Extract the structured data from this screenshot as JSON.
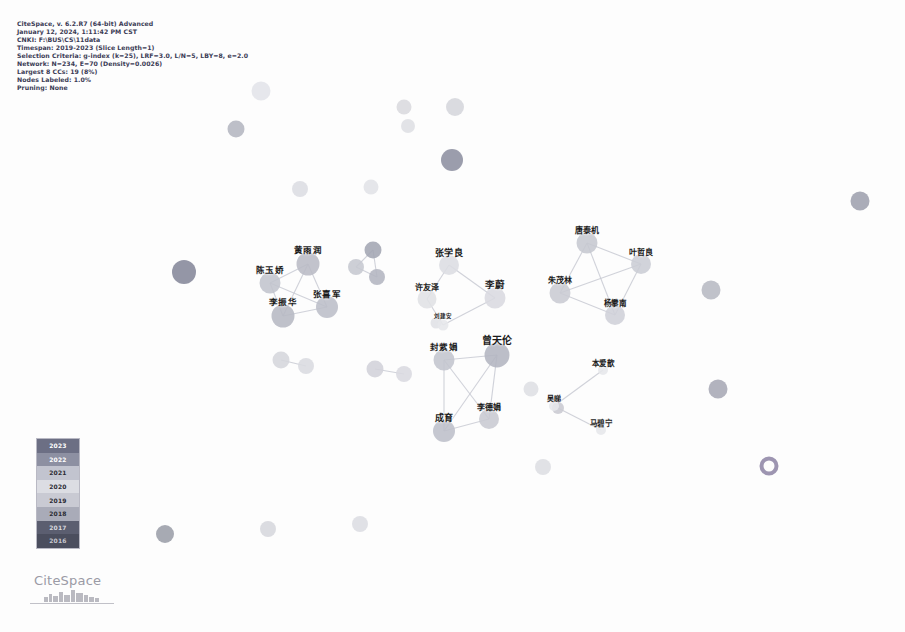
{
  "app": {
    "name": "CiteSpace",
    "title": "CiteSpace author co-occurrence network visualization"
  },
  "info_panel": {
    "name": "analysis-parameters",
    "lines": [
      "CiteSpace, v. 6.2.R7 (64-bit) Advanced",
      "January 12, 2024, 1:11:42 PM CST",
      "CNKI: F:\\BUS\\CS\\11data",
      "Timespan: 2019-2023 (Slice Length=1)",
      "Selection Criteria: g-index (k=25), LRF=3.0, L/N=5, LBY=8, e=2.0",
      "Network: N=234, E=70 (Density=0.0026)",
      "Largest 8 CCs: 19 (8%)",
      "Nodes Labeled: 1.0%",
      "Pruning: None"
    ]
  },
  "legend": {
    "name": "year-color-legend",
    "title": "Year",
    "bands": [
      {
        "year": "2023",
        "color": "#6c6f84",
        "text_color": "#ffffff"
      },
      {
        "year": "2022",
        "color": "#8d90a2",
        "text_color": "#ffffff"
      },
      {
        "year": "2021",
        "color": "#c2c4cf",
        "text_color": "#2b2b33"
      },
      {
        "year": "2020",
        "color": "#dcdde3",
        "text_color": "#2b2b33"
      },
      {
        "year": "2019",
        "color": "#c9cad3",
        "text_color": "#2b2b33"
      },
      {
        "year": "2018",
        "color": "#a9abb8",
        "text_color": "#2b2b33"
      },
      {
        "year": "2017",
        "color": "#5b5e70",
        "text_color": "#d8d8de"
      },
      {
        "year": "2016",
        "color": "#4b4e5e",
        "text_color": "#c8c8d0"
      }
    ]
  },
  "logo": {
    "wordmark": "CiteSpace",
    "graphic": "skyline-icon"
  },
  "chart_data": {
    "type": "scatter",
    "subtitle": "Timespan: 2019-2023 (Slice Length=1)",
    "xlabel": "",
    "ylabel": "",
    "xlim": [
      0,
      905
    ],
    "ylim": [
      0,
      632
    ],
    "grid": false,
    "legend_position": "bottom-left",
    "network_stats": {
      "nodes": 234,
      "edges": 70,
      "density": 0.0026,
      "modularity_note": "Largest 8 CCs: 19 (8%)",
      "nodes_labeled_pct": "1.0%"
    },
    "nodes": [
      {
        "id": "n1",
        "label": "",
        "x": 261,
        "y": 91,
        "r": 9.5,
        "color": "#e3e4e9"
      },
      {
        "id": "n2",
        "label": "",
        "x": 404,
        "y": 107,
        "r": 7.5,
        "color": "#d9dade"
      },
      {
        "id": "n3",
        "label": "",
        "x": 455,
        "y": 107,
        "r": 9.0,
        "color": "#d5d6dc"
      },
      {
        "id": "n4",
        "label": "",
        "x": 236,
        "y": 129,
        "r": 8.5,
        "color": "#b4b6c0"
      },
      {
        "id": "n5",
        "label": "",
        "x": 408,
        "y": 126,
        "r": 7.0,
        "color": "#dedfe4"
      },
      {
        "id": "n6",
        "label": "",
        "x": 452,
        "y": 160,
        "r": 11.0,
        "color": "#8d90a0"
      },
      {
        "id": "n7",
        "label": "",
        "x": 300,
        "y": 189,
        "r": 8.0,
        "color": "#dcdde2"
      },
      {
        "id": "n8",
        "label": "",
        "x": 371,
        "y": 187,
        "r": 7.5,
        "color": "#e1e2e7"
      },
      {
        "id": "n9",
        "label": "",
        "x": 860,
        "y": 201,
        "r": 9.5,
        "color": "#9ea1ae"
      },
      {
        "id": "n10",
        "label": "",
        "x": 373,
        "y": 250,
        "r": 8.5,
        "color": "#a3a6b3"
      },
      {
        "id": "n11",
        "label": "",
        "x": 356,
        "y": 267,
        "r": 8.0,
        "color": "#c6c8d0"
      },
      {
        "id": "n12",
        "label": "",
        "x": 377,
        "y": 277,
        "r": 8.0,
        "color": "#b3b5c0"
      },
      {
        "id": "n13",
        "label": "",
        "x": 184,
        "y": 272,
        "r": 12.0,
        "color": "#85889a"
      },
      {
        "id": "n14",
        "label": "",
        "x": 711,
        "y": 290,
        "r": 9.5,
        "color": "#b7b9c3"
      },
      {
        "id": "n15",
        "label": "",
        "x": 281,
        "y": 360,
        "r": 8.5,
        "color": "#d5d6dc"
      },
      {
        "id": "n16",
        "label": "",
        "x": 306,
        "y": 366,
        "r": 8.0,
        "color": "#dadbe0"
      },
      {
        "id": "n17",
        "label": "",
        "x": 375,
        "y": 369,
        "r": 8.5,
        "color": "#d1d2d9"
      },
      {
        "id": "n18",
        "label": "",
        "x": 404,
        "y": 374,
        "r": 8.0,
        "color": "#d9dae0"
      },
      {
        "id": "n19",
        "label": "",
        "x": 531,
        "y": 389,
        "r": 7.5,
        "color": "#dedfe4"
      },
      {
        "id": "n20",
        "label": "",
        "x": 718,
        "y": 389,
        "r": 9.5,
        "color": "#a7a9b5"
      },
      {
        "id": "n21",
        "label": "",
        "x": 543,
        "y": 467,
        "r": 8.0,
        "color": "#dddee3"
      },
      {
        "id": "n22",
        "label": "",
        "x": 769,
        "y": 466,
        "r": 9.5,
        "color": "#8f86a6",
        "ring": true
      },
      {
        "id": "n23",
        "label": "",
        "x": 165,
        "y": 534,
        "r": 9.0,
        "color": "#9b9ea9"
      },
      {
        "id": "n24",
        "label": "",
        "x": 268,
        "y": 529,
        "r": 8.0,
        "color": "#d6d7dd"
      },
      {
        "id": "n25",
        "label": "",
        "x": 360,
        "y": 524,
        "r": 8.0,
        "color": "#dcdde2"
      },
      {
        "id": "n26",
        "label": "",
        "x": 558,
        "y": 408,
        "r": 6.0,
        "color": "#c9cad2"
      },
      {
        "id": "n27",
        "label": "",
        "x": 436,
        "y": 323,
        "r": 5.5,
        "color": "#e0e1e6"
      },
      {
        "id": "a1",
        "label": "黄雨润",
        "x": 308,
        "y": 264,
        "r": 11.5,
        "color": "#b9bbc5",
        "fs": 8.5
      },
      {
        "id": "a2",
        "label": "陈玉娇",
        "x": 270,
        "y": 283,
        "r": 10.5,
        "color": "#c2c4cd",
        "fs": 8.5
      },
      {
        "id": "a3",
        "label": "张喜军",
        "x": 327,
        "y": 307,
        "r": 11.0,
        "color": "#bcbec8",
        "fs": 8.5
      },
      {
        "id": "a4",
        "label": "李振华",
        "x": 283,
        "y": 316,
        "r": 11.5,
        "color": "#b6b8c3",
        "fs": 8.5
      },
      {
        "id": "b1",
        "label": "张学良",
        "x": 449,
        "y": 265,
        "r": 10.0,
        "color": "#dcdde2",
        "fs": 9
      },
      {
        "id": "b2",
        "label": "许友泽",
        "x": 427,
        "y": 299,
        "r": 9.5,
        "color": "#e0e1e5",
        "fs": 8
      },
      {
        "id": "b3",
        "label": "李蔚",
        "x": 495,
        "y": 298,
        "r": 10.5,
        "color": "#d9dae0",
        "fs": 9.5
      },
      {
        "id": "b4",
        "label": "刘建安",
        "x": 443,
        "y": 325,
        "r": 5.5,
        "color": "#e6e7ea",
        "fs": 5.5
      },
      {
        "id": "c1",
        "label": "唐泰机",
        "x": 587,
        "y": 243,
        "r": 10.5,
        "color": "#c6c8d0",
        "fs": 8
      },
      {
        "id": "c2",
        "label": "叶哲良",
        "x": 641,
        "y": 264,
        "r": 10.0,
        "color": "#cbcdd5",
        "fs": 8
      },
      {
        "id": "c3",
        "label": "朱茂林",
        "x": 560,
        "y": 293,
        "r": 10.5,
        "color": "#c9cbd3",
        "fs": 8
      },
      {
        "id": "c4",
        "label": "杨攀南",
        "x": 615,
        "y": 315,
        "r": 10.0,
        "color": "#cfd0d8",
        "fs": 7.5
      },
      {
        "id": "d1",
        "label": "封紫娟",
        "x": 444,
        "y": 360,
        "r": 10.5,
        "color": "#c3c5ce",
        "fs": 8.5
      },
      {
        "id": "d2",
        "label": "曾天伦",
        "x": 497,
        "y": 355,
        "r": 12.5,
        "color": "#b3b5c0",
        "fs": 10
      },
      {
        "id": "d3",
        "label": "李德娟",
        "x": 489,
        "y": 419,
        "r": 10.0,
        "color": "#c8cad2",
        "fs": 8
      },
      {
        "id": "d4",
        "label": "成育",
        "x": 444,
        "y": 431,
        "r": 11.0,
        "color": "#bdbfc9",
        "fs": 9
      },
      {
        "id": "e1",
        "label": "本爱歆",
        "x": 603,
        "y": 370,
        "r": 5.0,
        "color": "#e6e7ea",
        "fs": 7.5
      },
      {
        "id": "e2",
        "label": "吴睇",
        "x": 554,
        "y": 406,
        "r": 5.0,
        "color": "#e6e7ea",
        "fs": 7
      },
      {
        "id": "e3",
        "label": "马碧宁",
        "x": 601,
        "y": 430,
        "r": 5.0,
        "color": "#e6e7ea",
        "fs": 7.5
      }
    ],
    "edges": [
      {
        "source": "a1",
        "target": "a2"
      },
      {
        "source": "a1",
        "target": "a3"
      },
      {
        "source": "a1",
        "target": "a4"
      },
      {
        "source": "a2",
        "target": "a4"
      },
      {
        "source": "a3",
        "target": "a4"
      },
      {
        "source": "a2",
        "target": "a3"
      },
      {
        "source": "c1",
        "target": "c2"
      },
      {
        "source": "c1",
        "target": "c3"
      },
      {
        "source": "c1",
        "target": "c4"
      },
      {
        "source": "c2",
        "target": "c4"
      },
      {
        "source": "c3",
        "target": "c4"
      },
      {
        "source": "c2",
        "target": "c3"
      },
      {
        "source": "d1",
        "target": "d2"
      },
      {
        "source": "d1",
        "target": "d4"
      },
      {
        "source": "d1",
        "target": "d3"
      },
      {
        "source": "d2",
        "target": "d3"
      },
      {
        "source": "d3",
        "target": "d4"
      },
      {
        "source": "d2",
        "target": "d4"
      },
      {
        "source": "b1",
        "target": "b2"
      },
      {
        "source": "b1",
        "target": "b3"
      },
      {
        "source": "b2",
        "target": "b4"
      },
      {
        "source": "b3",
        "target": "b4"
      },
      {
        "source": "n10",
        "target": "n11"
      },
      {
        "source": "n11",
        "target": "n12"
      },
      {
        "source": "n10",
        "target": "n12"
      },
      {
        "source": "n15",
        "target": "n16"
      },
      {
        "source": "n17",
        "target": "n18"
      },
      {
        "source": "e1",
        "target": "e2"
      },
      {
        "source": "e2",
        "target": "e3"
      }
    ]
  }
}
